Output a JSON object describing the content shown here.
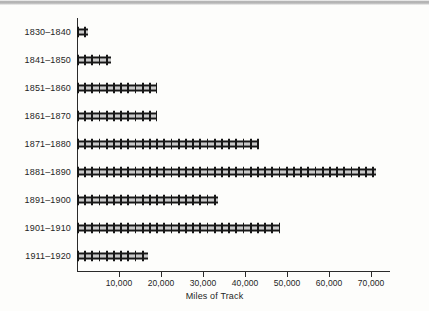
{
  "chart_data": {
    "type": "bar",
    "orientation": "horizontal",
    "title": "",
    "xlabel": "Miles of Track",
    "ylabel": "",
    "categories": [
      "1830–1840",
      "1841–1850",
      "1851–1860",
      "1861–1870",
      "1871–1880",
      "1881–1890",
      "1891–1900",
      "1901–1910",
      "1911–1920"
    ],
    "values": [
      2500,
      8000,
      19000,
      19000,
      43200,
      71200,
      33500,
      48200,
      16900
    ],
    "xlim": [
      0,
      74500
    ],
    "xticks": [
      10000,
      20000,
      30000,
      40000,
      50000,
      60000,
      70000
    ],
    "xtick_labels": [
      "10,000",
      "20,000",
      "30,000",
      "40,000",
      "50,000",
      "60,000",
      "70,000"
    ],
    "grid": false,
    "legend": null,
    "bar_style": "railroad-track",
    "colors": {
      "bar": "#171717",
      "axis": "#2a2a2a",
      "text": "#1f1f1f",
      "background": "#fdfdfb"
    }
  }
}
